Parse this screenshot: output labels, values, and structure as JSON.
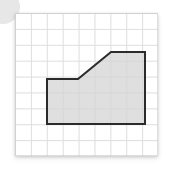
{
  "figure": {
    "canvas": {
      "width": 176,
      "height": 171,
      "background": "#ffffff"
    },
    "decoration": {
      "name": "corner-circle",
      "color": "#e3e3e3"
    },
    "grid": {
      "origin_x": 15,
      "origin_y": 13,
      "width": 143,
      "height": 143,
      "cell_size": 15.9,
      "columns": 9,
      "rows": 9,
      "line_color": "#c9c9c9",
      "paper_color": "#ffffff"
    },
    "polygon": {
      "name": "shaded-polygon",
      "fill": "#d4d4d4",
      "fill_opacity": 0.75,
      "stroke": "#2b2b2b",
      "stroke_width": 2,
      "vertex_count": 6,
      "points_px": "47,79 78,79 111,52 145,52 145,124 47,124",
      "points_grid": "2,4.15 4,4.15 6,2.45 8.2,2.45 8.2,7 2,7",
      "edges": [
        {
          "name": "top-left-horizontal",
          "type": "horizontal"
        },
        {
          "name": "diagonal-rise",
          "type": "diagonal"
        },
        {
          "name": "top-right-horizontal",
          "type": "horizontal"
        },
        {
          "name": "right-vertical",
          "type": "vertical"
        },
        {
          "name": "bottom-horizontal",
          "type": "horizontal"
        },
        {
          "name": "left-vertical",
          "type": "vertical"
        }
      ]
    }
  }
}
